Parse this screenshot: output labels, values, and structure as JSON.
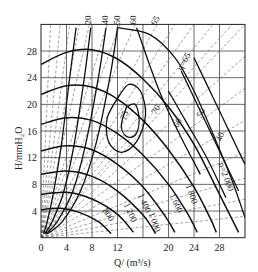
{
  "chart_data": {
    "type": "line",
    "title": "",
    "xlabel": "Q/ (m³/s)",
    "ylabel": "H/mmH₂O",
    "xlim": [
      0,
      32
    ],
    "ylim": [
      0,
      32
    ],
    "xticks": [
      0,
      4,
      8,
      12,
      16,
      20,
      24,
      28
    ],
    "xtick_labels": [
      "0",
      "4",
      "8",
      "12",
      "",
      "20",
      "24",
      "28"
    ],
    "yticks": [
      4,
      8,
      12,
      16,
      20,
      24,
      28
    ],
    "grid": true,
    "grid_step": 4,
    "speed_curves": [
      {
        "name": "n=800",
        "label": "800",
        "points": [
          [
            0,
            4.2
          ],
          [
            3,
            4.4
          ],
          [
            6,
            3.8
          ],
          [
            9,
            2.4
          ],
          [
            11,
            0.6
          ]
        ]
      },
      {
        "name": "n=1000",
        "label": "1 000",
        "points": [
          [
            0,
            6.5
          ],
          [
            4,
            6.8
          ],
          [
            8,
            5.8
          ],
          [
            12,
            3.5
          ],
          [
            14.5,
            0.8
          ]
        ]
      },
      {
        "name": "n=1200",
        "label": "1 200",
        "points": [
          [
            0,
            9.5
          ],
          [
            4,
            10
          ],
          [
            8,
            9.2
          ],
          [
            12,
            7
          ],
          [
            16,
            3.4
          ],
          [
            18,
            0.6
          ]
        ]
      },
      {
        "name": "n=1400",
        "label": "1 400",
        "points": [
          [
            0,
            13
          ],
          [
            4,
            13.8
          ],
          [
            8,
            13.2
          ],
          [
            12,
            11
          ],
          [
            16,
            7.6
          ],
          [
            19.5,
            3.2
          ],
          [
            21,
            0.8
          ]
        ]
      },
      {
        "name": "n=1600",
        "label": "1 600",
        "points": [
          [
            0,
            17
          ],
          [
            4,
            18
          ],
          [
            8,
            17.6
          ],
          [
            12,
            15.6
          ],
          [
            16,
            12.4
          ],
          [
            20,
            8
          ],
          [
            23,
            3.6
          ],
          [
            24.5,
            0.8
          ]
        ]
      },
      {
        "name": "n=1800",
        "label": "1 800",
        "points": [
          [
            0,
            21.5
          ],
          [
            4,
            22.8
          ],
          [
            8,
            22.6
          ],
          [
            12,
            20.8
          ],
          [
            16,
            17.6
          ],
          [
            20,
            13.2
          ],
          [
            24,
            7.6
          ],
          [
            26.5,
            3
          ],
          [
            27.5,
            0.8
          ]
        ]
      },
      {
        "name": "n=2000",
        "label": "n=2 000",
        "points": [
          [
            0,
            26
          ],
          [
            4,
            27.8
          ],
          [
            8,
            28.2
          ],
          [
            12,
            26.8
          ],
          [
            16,
            23.8
          ],
          [
            20,
            19.6
          ],
          [
            24,
            14
          ],
          [
            28,
            6.5
          ],
          [
            31,
            0.8
          ]
        ]
      }
    ],
    "efficiency_curves": [
      {
        "name": "η=40",
        "label": "40",
        "points": [
          [
            5.5,
            31.5
          ],
          [
            4.5,
            24
          ],
          [
            3.2,
            14
          ],
          [
            2,
            7
          ],
          [
            1,
            2.5
          ],
          [
            0.4,
            0.6
          ]
        ]
      },
      {
        "name": "η=50",
        "label": "50",
        "points": [
          [
            7.8,
            31.5
          ],
          [
            6.8,
            24
          ],
          [
            5.2,
            14
          ],
          [
            3.6,
            7
          ],
          [
            1.8,
            2.5
          ],
          [
            0.6,
            0.6
          ]
        ]
      },
      {
        "name": "η=60",
        "label": "60",
        "points": [
          [
            10.2,
            31.5
          ],
          [
            9,
            24
          ],
          [
            7,
            14
          ],
          [
            5,
            7
          ],
          [
            2.6,
            2.5
          ],
          [
            0.8,
            0.6
          ]
        ]
      },
      {
        "name": "η=65",
        "label": "65",
        "points": [
          [
            12,
            31.5
          ],
          [
            10.8,
            24
          ],
          [
            8.6,
            14
          ],
          [
            6.2,
            7
          ],
          [
            3.4,
            2.5
          ],
          [
            1,
            0.6
          ]
        ]
      },
      {
        "name": "η=70",
        "label": "70",
        "points": [
          [
            12.4,
            21.5
          ],
          [
            13.8,
            23
          ],
          [
            15.6,
            22
          ],
          [
            16.4,
            18.4
          ],
          [
            15,
            14.4
          ],
          [
            12.6,
            12.8
          ],
          [
            10.6,
            14.4
          ],
          [
            10.4,
            18
          ],
          [
            12.4,
            21.5
          ]
        ]
      },
      {
        "name": "η=75",
        "label": "75",
        "points": [
          [
            13.4,
            19.6
          ],
          [
            14.8,
            20
          ],
          [
            15.4,
            17.6
          ],
          [
            14.8,
            15.4
          ],
          [
            13.4,
            15.2
          ],
          [
            12.6,
            16.8
          ],
          [
            13.4,
            19.6
          ]
        ]
      },
      {
        "name": "η=70 (right)",
        "label": "70",
        "points": [
          [
            15,
            31.5
          ],
          [
            17,
            26
          ],
          [
            19,
            21
          ],
          [
            22,
            15
          ],
          [
            25,
            9.5
          ]
        ]
      },
      {
        "name": "η=65 (outer)",
        "label": "η=65",
        "points": [
          [
            12,
            31.5
          ],
          [
            17,
            30.5
          ],
          [
            21,
            27
          ],
          [
            24,
            22
          ],
          [
            27,
            15.5
          ],
          [
            30,
            8.5
          ],
          [
            32,
            3
          ]
        ]
      },
      {
        "name": "η=60 (right)",
        "label": "60",
        "points": [
          [
            20,
            22
          ],
          [
            23,
            17
          ],
          [
            26,
            12
          ],
          [
            29,
            6
          ]
        ]
      },
      {
        "name": "η=50 (right)",
        "label": "50",
        "points": [
          [
            22,
            25
          ],
          [
            25,
            19
          ],
          [
            28,
            13
          ],
          [
            31,
            7
          ]
        ]
      },
      {
        "name": "η=40 (right)",
        "label": "40",
        "points": [
          [
            24,
            27
          ],
          [
            27,
            21
          ],
          [
            30,
            15
          ],
          [
            32,
            11
          ]
        ]
      }
    ],
    "dashed_rays": {
      "labels": [
        "20",
        "40",
        "50",
        "60",
        "65"
      ],
      "top_positions_Q": [
        7.6,
        10.4,
        12.4,
        14.8,
        18.2
      ]
    },
    "annotations": [
      "20",
      "40",
      "50",
      "60",
      "65",
      "η=65",
      "70",
      "75",
      "60",
      "50",
      "40",
      "n=2 000",
      "1 800",
      "1 600",
      "1 400",
      "1 200",
      "1 000",
      "800"
    ]
  }
}
